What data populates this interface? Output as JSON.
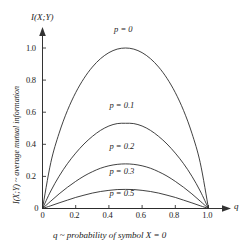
{
  "chart_data": {
    "type": "line",
    "title": "",
    "xlabel": "q ~ probability of symbol X = 0",
    "ylabel": "I(X;Y) ~ average mutual information",
    "y_axis_symbol": "I(X;Y)",
    "x_axis_symbol": "q",
    "xlim": [
      0,
      1
    ],
    "ylim": [
      0,
      1.08
    ],
    "grid": false,
    "legend_position": "inline-above-curve",
    "xticks": [
      0,
      0.2,
      0.4,
      0.6,
      0.8,
      1.0
    ],
    "xtick_labels": [
      "0",
      "0.2",
      "0.4",
      "0.6",
      "0.8",
      "1.0"
    ],
    "yticks": [
      0,
      0.2,
      0.4,
      0.6,
      0.8,
      1.0
    ],
    "ytick_labels": [
      "0",
      "0.2",
      "0.4",
      "0.6",
      "0.8",
      "1.0"
    ],
    "series": [
      {
        "name": "p = 0",
        "label": "p = 0",
        "p": 0,
        "peak": 1.0,
        "color": "#2b2b2b",
        "x": [
          0,
          0.05,
          0.1,
          0.15,
          0.2,
          0.25,
          0.3,
          0.35,
          0.4,
          0.45,
          0.5,
          0.55,
          0.6,
          0.65,
          0.7,
          0.75,
          0.8,
          0.85,
          0.9,
          0.95,
          1
        ],
        "values": [
          0,
          0.286,
          0.469,
          0.61,
          0.722,
          0.811,
          0.881,
          0.934,
          0.971,
          0.993,
          1.0,
          0.993,
          0.971,
          0.934,
          0.881,
          0.811,
          0.722,
          0.61,
          0.469,
          0.286,
          0
        ]
      },
      {
        "name": "p = 0.1",
        "label": "p = 0.1",
        "p": 0.1,
        "peak": 0.531,
        "color": "#2b2b2b",
        "x": [
          0,
          0.05,
          0.1,
          0.15,
          0.2,
          0.25,
          0.3,
          0.35,
          0.4,
          0.45,
          0.5,
          0.55,
          0.6,
          0.65,
          0.7,
          0.75,
          0.8,
          0.85,
          0.9,
          0.95,
          1
        ],
        "values": [
          0,
          0.109,
          0.201,
          0.279,
          0.345,
          0.402,
          0.449,
          0.487,
          0.514,
          0.529,
          0.531,
          0.529,
          0.514,
          0.487,
          0.449,
          0.402,
          0.345,
          0.279,
          0.201,
          0.109,
          0
        ]
      },
      {
        "name": "p = 0.2",
        "label": "p = 0.2",
        "p": 0.2,
        "peak": 0.278,
        "color": "#2b2b2b",
        "x": [
          0,
          0.05,
          0.1,
          0.15,
          0.2,
          0.25,
          0.3,
          0.35,
          0.4,
          0.45,
          0.5,
          0.55,
          0.6,
          0.65,
          0.7,
          0.75,
          0.8,
          0.85,
          0.9,
          0.95,
          1
        ],
        "values": [
          0,
          0.046,
          0.091,
          0.132,
          0.169,
          0.202,
          0.229,
          0.251,
          0.266,
          0.275,
          0.278,
          0.275,
          0.266,
          0.251,
          0.229,
          0.202,
          0.169,
          0.132,
          0.091,
          0.046,
          0
        ]
      },
      {
        "name": "p = 0.3",
        "label": "p = 0.3",
        "p": 0.3,
        "peak": 0.119,
        "color": "#2b2b2b",
        "x": [
          0,
          0.05,
          0.1,
          0.15,
          0.2,
          0.25,
          0.3,
          0.35,
          0.4,
          0.45,
          0.5,
          0.55,
          0.6,
          0.65,
          0.7,
          0.75,
          0.8,
          0.85,
          0.9,
          0.95,
          1
        ],
        "values": [
          0,
          0.017,
          0.035,
          0.052,
          0.069,
          0.083,
          0.096,
          0.106,
          0.113,
          0.118,
          0.119,
          0.118,
          0.113,
          0.106,
          0.096,
          0.083,
          0.069,
          0.052,
          0.035,
          0.017,
          0
        ]
      },
      {
        "name": "p = 0.5",
        "label": "p = 0.5",
        "p": 0.5,
        "peak": 0.0,
        "color": "#2b2b2b",
        "x": [
          0,
          0.25,
          0.5,
          0.75,
          1
        ],
        "values": [
          0,
          0,
          0,
          0,
          0
        ]
      }
    ],
    "curve_label_positions": [
      {
        "label": "p = 0",
        "x": 0.5,
        "y": 1.085
      },
      {
        "label": "p = 0.1",
        "x": 0.5,
        "y": 0.615
      },
      {
        "label": "p = 0.2",
        "x": 0.5,
        "y": 0.36
      },
      {
        "label": "p = 0.3",
        "x": 0.5,
        "y": 0.2
      },
      {
        "label": "p = 0.5",
        "x": 0.5,
        "y": 0.063
      }
    ]
  },
  "colors": {
    "curve": "#2b2b2b",
    "axis": "#333333",
    "text": "#1a1a1a",
    "background": "#ffffff"
  }
}
